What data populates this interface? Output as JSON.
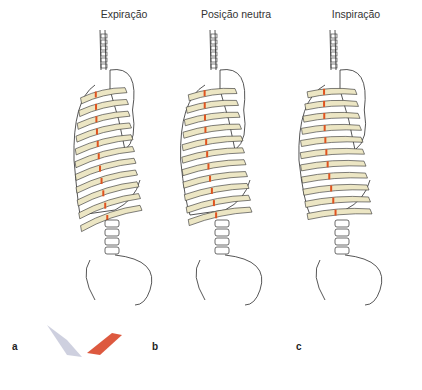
{
  "figure": {
    "titles": [
      "Expiração",
      "Posição neutra",
      "Inspiração"
    ],
    "panels": [
      {
        "label": "a",
        "external_muscle": "relaxed",
        "internal_muscle": "active"
      },
      {
        "label": "b",
        "external_muscle": "neutral",
        "internal_muscle": "neutral"
      },
      {
        "label": "c",
        "external_muscle": "active",
        "internal_muscle": "relaxed"
      }
    ],
    "colors": {
      "bone": "#ece6c4",
      "outline": "#2b2b2b",
      "cartilage_mark": "#e0531f",
      "muscle_active": "#d9472a",
      "muscle_neutral": "#eb9a80",
      "muscle_relaxed": "#c9cbdc"
    }
  }
}
